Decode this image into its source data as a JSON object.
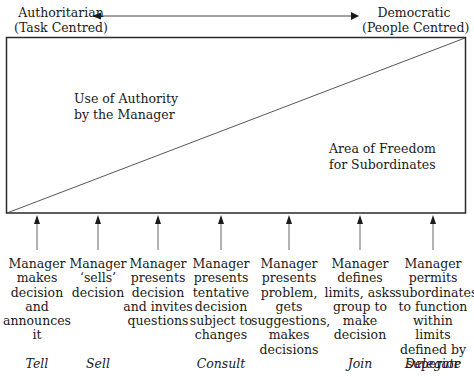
{
  "diagram": {
    "title_left": [
      "Authoritarian",
      "(Task Centred)"
    ],
    "title_right": [
      "Democratic",
      "(People Centred)"
    ],
    "region_upper_label": [
      "Use of Authority",
      "by the Manager"
    ],
    "region_lower_label": [
      "Area of Freedom",
      "for Subordinates"
    ],
    "continuum": [
      {
        "behaviour": "Manager makes decision and announces it",
        "style": "Tell",
        "x": 37
      },
      {
        "behaviour": "Manager ‘sells’ decision",
        "style": "Sell",
        "x": 98
      },
      {
        "behaviour": "Manager presents decision and invites questions",
        "style": "",
        "x": 158
      },
      {
        "behaviour": "Manager presents tentative decision subject to changes",
        "style": "Consult",
        "x": 221
      },
      {
        "behaviour": "Manager presents problem, gets suggestions, makes decisions",
        "style": "",
        "x": 289
      },
      {
        "behaviour": "Manager defines limits, asks group to make decision",
        "style": "Join",
        "x": 360
      },
      {
        "behaviour": "Manager permits subordinates to function within limits defined by superior",
        "style": "Delegate",
        "x": 433
      }
    ],
    "colors": {
      "line": "#2a2a2a",
      "arrow": "#555555",
      "text": "#1a1a1a"
    }
  },
  "labels": {
    "left_line1": "Authoritarian",
    "left_line2": "(Task Centred)",
    "right_line1": "Democratic",
    "right_line2": "(People Centred)",
    "upper1": "Use of Authority",
    "upper2": "by the Manager",
    "lower1": "Area of Freedom",
    "lower2": "for Subordinates"
  },
  "behaviours": [
    [
      "Manager",
      "makes",
      "decision",
      "and",
      "announces",
      "it"
    ],
    [
      "Manager",
      "‘sells’",
      "decision"
    ],
    [
      "Manager",
      "presents",
      "decision",
      "and invites",
      "questions"
    ],
    [
      "Manager",
      "presents",
      "tentative",
      "decision",
      "subject to",
      "changes"
    ],
    [
      "Manager",
      "presents",
      "problem,",
      "gets",
      "suggestions,",
      "makes",
      "decisions"
    ],
    [
      "Manager",
      "defines",
      "limits, asks",
      "group to",
      "make",
      "decision"
    ],
    [
      "Manager",
      "permits",
      "subordinates",
      "to function",
      "within limits",
      "defined by",
      "superior"
    ]
  ],
  "styles": [
    "Tell",
    "Sell",
    "",
    "Consult",
    "",
    "Join",
    "Delegate"
  ]
}
